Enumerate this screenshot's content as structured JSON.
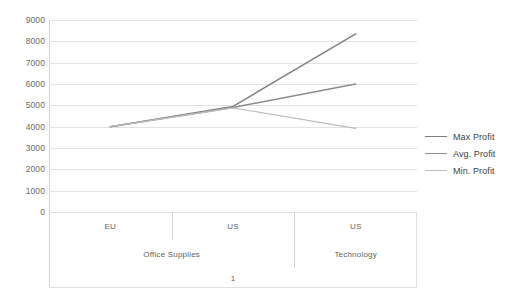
{
  "chart_data": {
    "type": "line",
    "title": "",
    "xlabel": "",
    "ylabel": "",
    "ylim": [
      0,
      9000
    ],
    "ytick_step": 1000,
    "yticks": [
      "9000",
      "8000",
      "7000",
      "6000",
      "5000",
      "4000",
      "3000",
      "2000",
      "1000",
      "0"
    ],
    "grid": true,
    "legend_position": "right",
    "x": [
      "EU",
      "US",
      "US"
    ],
    "categories": [
      "EU",
      "US",
      "US"
    ],
    "category_levels": [
      {
        "name": "region",
        "cells": [
          {
            "label": "EU",
            "span": 1
          },
          {
            "label": "US",
            "span": 1
          },
          {
            "label": "US",
            "span": 1
          }
        ]
      },
      {
        "name": "category",
        "cells": [
          {
            "label": "Office Supplies",
            "span": 2
          },
          {
            "label": "Technology",
            "span": 1
          }
        ]
      },
      {
        "name": "group",
        "cells": [
          {
            "label": "1",
            "span": 3
          }
        ]
      }
    ],
    "series": [
      {
        "name": "Max Profit",
        "values": [
          4000,
          4950,
          8350
        ],
        "color": "#808080"
      },
      {
        "name": "Avg. Profit",
        "values": [
          4000,
          4900,
          6000
        ],
        "color": "#8c8c8c"
      },
      {
        "name": "Min. Profit",
        "values": [
          4000,
          4880,
          3920
        ],
        "color": "#bdbdbd"
      }
    ]
  },
  "legend": {
    "items": [
      {
        "label": "Max Profit",
        "color": "#808080"
      },
      {
        "label": "Avg. Profit",
        "color": "#8c8c8c"
      },
      {
        "label": "Min. Profit",
        "color": "#bdbdbd"
      }
    ]
  },
  "colors": {
    "gridline": "#e2e2e2",
    "axis": "#d4d4d4",
    "tick_text": "#6a6a6a",
    "category_text": "#5f5f5f",
    "legend_text": "#3f3f3f",
    "background": "#ffffff"
  }
}
